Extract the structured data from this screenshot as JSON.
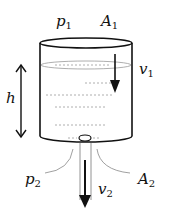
{
  "diagram": {
    "labels": {
      "p1": {
        "base": "p",
        "sub": "1"
      },
      "A1": {
        "base": "A",
        "sub": "1"
      },
      "v1": {
        "base": "v",
        "sub": "1"
      },
      "h": {
        "base": "h",
        "sub": ""
      },
      "p2": {
        "base": "p",
        "sub": "2"
      },
      "A2": {
        "base": "A",
        "sub": "2"
      },
      "v2": {
        "base": "v",
        "sub": "2"
      }
    },
    "colors": {
      "stroke": "#111111",
      "water_dash": "#888888",
      "background": "#ffffff"
    }
  }
}
